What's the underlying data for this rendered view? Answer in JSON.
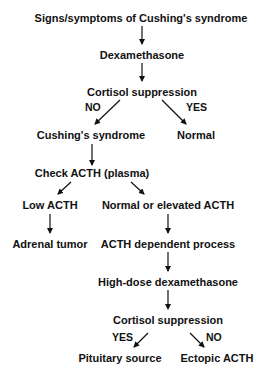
{
  "diagram": {
    "nodes": {
      "start": "Signs/symptoms of Cushing's syndrome",
      "dexa": "Dexamethasone",
      "suppression1": "Cortisol suppression",
      "cushings": "Cushing's syndrome",
      "normal": "Normal",
      "check_acth": "Check ACTH (plasma)",
      "low_acth": "Low ACTH",
      "normal_elevated_acth": "Normal or elevated ACTH",
      "adrenal_tumor": "Adrenal tumor",
      "acth_dependent": "ACTH dependent process",
      "high_dose_dexa": "High-dose dexamethasone",
      "suppression2": "Cortisol suppression",
      "pituitary": "Pituitary source",
      "ectopic": "Ectopic ACTH"
    },
    "edge_labels": {
      "s1_no": "NO",
      "s1_yes": "YES",
      "s2_yes": "YES",
      "s2_no": "NO"
    },
    "edges": [
      [
        "start",
        "dexa"
      ],
      [
        "dexa",
        "suppression1"
      ],
      [
        "suppression1",
        "cushings",
        "NO"
      ],
      [
        "suppression1",
        "normal",
        "YES"
      ],
      [
        "cushings",
        "check_acth"
      ],
      [
        "check_acth",
        "low_acth"
      ],
      [
        "check_acth",
        "normal_elevated_acth"
      ],
      [
        "low_acth",
        "adrenal_tumor"
      ],
      [
        "normal_elevated_acth",
        "acth_dependent"
      ],
      [
        "acth_dependent",
        "high_dose_dexa"
      ],
      [
        "high_dose_dexa",
        "suppression2"
      ],
      [
        "suppression2",
        "pituitary",
        "YES"
      ],
      [
        "suppression2",
        "ectopic",
        "NO"
      ]
    ]
  }
}
